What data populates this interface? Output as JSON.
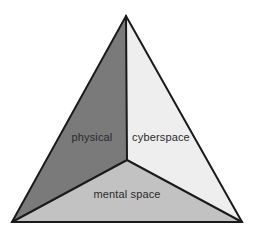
{
  "diagram": {
    "type": "partitioned-triangle",
    "background_color": "#ffffff",
    "stroke_color": "#1a1a1a",
    "stroke_width": 2,
    "geometry": {
      "apex": [
        126,
        16
      ],
      "bottom_left": [
        12,
        222
      ],
      "bottom_right": [
        242,
        222
      ],
      "center": [
        127,
        160
      ]
    },
    "regions": [
      {
        "id": "physical",
        "label": "physical",
        "fill_color": "#7a7a7a",
        "label_position": [
          92,
          141
        ],
        "polygon": "126,16 127,160 12,222"
      },
      {
        "id": "cyberspace",
        "label": "cyberspace",
        "fill_color": "#eeeeee",
        "label_position": [
          161,
          141
        ],
        "polygon": "126,16 242,222 127,160"
      },
      {
        "id": "mental-space",
        "label": "mental space",
        "fill_color": "#c2c2c2",
        "label_position": [
          127,
          198
        ],
        "polygon": "127,160 242,222 12,222"
      }
    ],
    "dividers": [
      {
        "id": "center-to-apex",
        "from": [
          127,
          160
        ],
        "to": [
          126,
          16
        ]
      },
      {
        "id": "center-to-bottom-left",
        "from": [
          127,
          160
        ],
        "to": [
          12,
          222
        ]
      },
      {
        "id": "center-to-bottom-right",
        "from": [
          127,
          160
        ],
        "to": [
          242,
          222
        ]
      }
    ],
    "label_text_color": "#2b2b2b"
  }
}
